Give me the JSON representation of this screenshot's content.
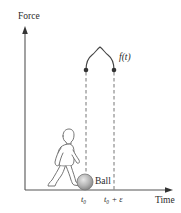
{
  "diagram": {
    "y_axis_label": "Force",
    "x_axis_label": "Time",
    "curve_label": "f(t)",
    "ball_label": "Ball",
    "tick_start": "t₀",
    "tick_end": "t₀ + ε",
    "elements": [
      "force-axis",
      "time-axis",
      "impulse-curve",
      "dashed-markers",
      "ball",
      "walking-person"
    ],
    "colors": {
      "axis": "#555555",
      "curve": "#444444",
      "dash": "#666666",
      "ball_fill": "#b8b8b8",
      "ball_stroke": "#777777",
      "person_stroke": "#666666"
    }
  }
}
